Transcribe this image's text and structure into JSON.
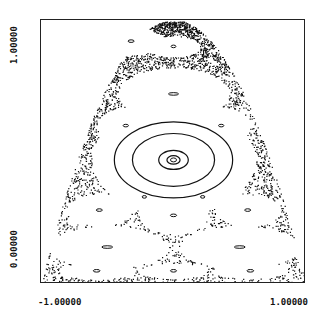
{
  "chart_data": {
    "type": "scatter",
    "title": "",
    "xlabel": "",
    "ylabel": "",
    "x_ticks": [
      "-1.00000",
      "1.00000"
    ],
    "y_ticks": [
      "0.00000",
      "1.00000"
    ],
    "xlim": [
      -1.0,
      1.0
    ],
    "ylim": [
      0.0,
      1.0
    ],
    "grid": false,
    "legend": null,
    "boundary": "parabola-like envelope from (-1,0) and (1,0) up to apex near (0,1)",
    "islands": [
      {
        "cx": 0.0,
        "cy": 0.47,
        "rx": 0.62,
        "ry": 0.2,
        "rings": 4,
        "label": "central island"
      },
      {
        "cx": 0.0,
        "cy": 0.72,
        "rx": 0.42,
        "ry": 0.1
      },
      {
        "cx": -0.32,
        "cy": 0.92,
        "rx": 0.25,
        "ry": 0.05
      },
      {
        "cx": 0.0,
        "cy": 0.9,
        "rx": 0.2,
        "ry": 0.04
      },
      {
        "cx": -0.36,
        "cy": 0.6,
        "rx": 0.22,
        "ry": 0.07
      },
      {
        "cx": 0.36,
        "cy": 0.6,
        "rx": 0.22,
        "ry": 0.07
      },
      {
        "cx": -0.22,
        "cy": 0.33,
        "rx": 0.18,
        "ry": 0.05
      },
      {
        "cx": 0.22,
        "cy": 0.33,
        "rx": 0.18,
        "ry": 0.05
      },
      {
        "cx": -0.56,
        "cy": 0.28,
        "rx": 0.25,
        "ry": 0.06
      },
      {
        "cx": 0.56,
        "cy": 0.28,
        "rx": 0.25,
        "ry": 0.06
      },
      {
        "cx": 0.0,
        "cy": 0.26,
        "rx": 0.26,
        "ry": 0.07
      },
      {
        "cx": -0.5,
        "cy": 0.14,
        "rx": 0.45,
        "ry": 0.08
      },
      {
        "cx": 0.5,
        "cy": 0.14,
        "rx": 0.45,
        "ry": 0.08
      },
      {
        "cx": -0.58,
        "cy": 0.05,
        "rx": 0.28,
        "ry": 0.03
      },
      {
        "cx": 0.0,
        "cy": 0.05,
        "rx": 0.25,
        "ry": 0.03
      },
      {
        "cx": 0.58,
        "cy": 0.05,
        "rx": 0.28,
        "ry": 0.03
      }
    ]
  },
  "axes": {
    "y_top_label": "1.00000",
    "y_bottom_label": "0.00000",
    "x_left_label": "-1.00000",
    "x_right_label": "1.00000"
  }
}
